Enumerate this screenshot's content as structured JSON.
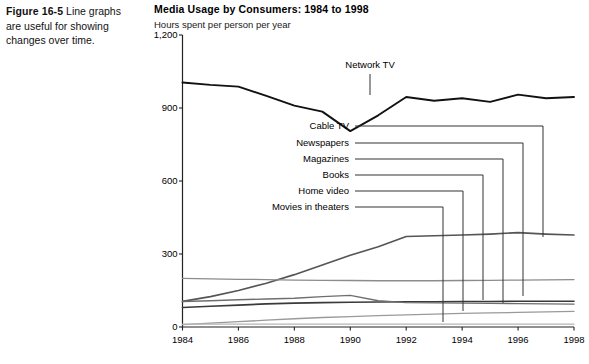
{
  "figure": {
    "label": "Figure 16-5",
    "caption": "Line graphs are useful for showing changes over time."
  },
  "chart": {
    "title": "Media Usage by Consumers: 1984 to 1998",
    "subtitle": "Hours spent per person per year"
  },
  "colors": {
    "axis": "#222222",
    "network_tv": "#111111",
    "cable_tv": "#555555",
    "newspapers": "#3a3a3a",
    "magazines": "#6e6e6e",
    "books": "#8c8c8c",
    "home_video": "#9a9a9a",
    "movies": "#b5b5b5",
    "leader": "#333333",
    "text": "#000000"
  },
  "chart_data": {
    "type": "line",
    "title": "Media Usage by Consumers: 1984 to 1998",
    "subtitle": "Hours spent per person per year",
    "xlabel": "",
    "ylabel": "Hours spent per person per year",
    "x": [
      1984,
      1985,
      1986,
      1987,
      1988,
      1989,
      1990,
      1991,
      1992,
      1993,
      1994,
      1995,
      1996,
      1997,
      1998
    ],
    "xlim": [
      1984,
      1998
    ],
    "xticks": [
      1984,
      1986,
      1988,
      1990,
      1992,
      1994,
      1996,
      1998
    ],
    "xticklabels": [
      "1984",
      "1986",
      "1988",
      "1990",
      "1992",
      "1994",
      "1996",
      "1998"
    ],
    "ylim": [
      0,
      1200
    ],
    "yticks": [
      0,
      300,
      600,
      900,
      1200
    ],
    "yticklabels": [
      "0",
      "300",
      "600",
      "900",
      "1,200"
    ],
    "grid": false,
    "legend": "callout-labels-right",
    "series": [
      {
        "name": "Network TV",
        "color": "#111111",
        "values": [
          1005,
          995,
          988,
          950,
          910,
          885,
          805,
          870,
          945,
          930,
          940,
          925,
          955,
          940,
          945
        ]
      },
      {
        "name": "Cable TV",
        "color": "#555555",
        "values": [
          105,
          125,
          150,
          180,
          215,
          255,
          295,
          330,
          372,
          375,
          378,
          382,
          388,
          382,
          378
        ]
      },
      {
        "name": "Newspapers",
        "color": "#3a3a3a",
        "values": [
          80,
          85,
          90,
          95,
          98,
          100,
          102,
          103,
          104,
          104,
          105,
          105,
          106,
          106,
          106
        ]
      },
      {
        "name": "Magazines",
        "color": "#6e6e6e",
        "values": [
          105,
          108,
          112,
          115,
          118,
          125,
          130,
          108,
          100,
          99,
          98,
          97,
          96,
          95,
          94
        ]
      },
      {
        "name": "Books",
        "color": "#8c8c8c",
        "values": [
          200,
          198,
          196,
          195,
          193,
          192,
          191,
          190,
          190,
          190,
          191,
          192,
          193,
          194,
          195
        ]
      },
      {
        "name": "Home video",
        "color": "#9a9a9a",
        "values": [
          10,
          16,
          22,
          28,
          34,
          39,
          43,
          47,
          50,
          53,
          56,
          58,
          60,
          62,
          64
        ]
      },
      {
        "name": "Movies in theaters",
        "color": "#b5b5b5",
        "values": [
          12,
          12,
          12,
          12,
          12,
          12,
          12,
          12,
          12,
          12,
          12,
          12,
          12,
          12,
          12
        ]
      }
    ],
    "callouts": [
      {
        "name": "Network TV",
        "label": "Network TV"
      },
      {
        "name": "Cable TV",
        "label": "Cable TV"
      },
      {
        "name": "Newspapers",
        "label": "Newspapers"
      },
      {
        "name": "Magazines",
        "label": "Magazines"
      },
      {
        "name": "Books",
        "label": "Books"
      },
      {
        "name": "Home video",
        "label": "Home video"
      },
      {
        "name": "Movies in theaters",
        "label": "Movies in theaters"
      }
    ]
  }
}
